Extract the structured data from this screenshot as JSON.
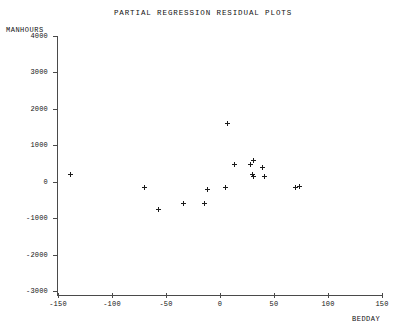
{
  "chart_data": {
    "type": "scatter",
    "title": "PARTIAL REGRESSION RESIDUAL PLOTS",
    "xlabel": "BEDDAY",
    "ylabel": "MANHOURS",
    "xlim": [
      -150,
      150
    ],
    "ylim": [
      -3000,
      4000
    ],
    "xticks": [
      -150,
      -100,
      -50,
      0,
      50,
      100,
      150
    ],
    "xtick_labels": [
      "-150",
      "-100",
      "-50",
      "0",
      "50",
      "100",
      "150"
    ],
    "yticks": [
      4000,
      3000,
      2000,
      1000,
      0,
      -1000,
      -2000,
      -3000
    ],
    "ytick_labels": [
      "4000",
      "3000",
      "2000",
      "1000",
      "0",
      "-1000",
      "-2000",
      "-3000"
    ],
    "grid": false,
    "legend": false,
    "marker": "plus",
    "marker_color": "#1b1b1b",
    "axis_color": "#4a4a4a",
    "points": [
      {
        "x": -138,
        "y": 210
      },
      {
        "x": -70,
        "y": -170
      },
      {
        "x": -57,
        "y": -750
      },
      {
        "x": -34,
        "y": -585
      },
      {
        "x": -14,
        "y": -585
      },
      {
        "x": -12,
        "y": -200
      },
      {
        "x": 5,
        "y": -150
      },
      {
        "x": 7,
        "y": 1610
      },
      {
        "x": 13,
        "y": 465
      },
      {
        "x": 28,
        "y": 465
      },
      {
        "x": 31,
        "y": 590
      },
      {
        "x": 30,
        "y": 210
      },
      {
        "x": 31,
        "y": 130
      },
      {
        "x": 39,
        "y": 400
      },
      {
        "x": 41,
        "y": 130
      },
      {
        "x": 70,
        "y": -170
      },
      {
        "x": 74,
        "y": -120
      }
    ]
  }
}
